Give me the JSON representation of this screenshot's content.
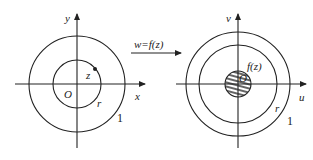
{
  "left_plane": {
    "axis_x_label": "x",
    "axis_y_label": "y",
    "origin_label": "O",
    "point_label": "z",
    "inner_radius_label": "r",
    "outer_radius_label": "1"
  },
  "mapping": {
    "label": "w=f(z)"
  },
  "right_plane": {
    "axis_u_label": "u",
    "axis_v_label": "v",
    "origin_label": "O",
    "image_label": "f(z)",
    "inner_radius_label": "r",
    "outer_radius_label": "1"
  }
}
